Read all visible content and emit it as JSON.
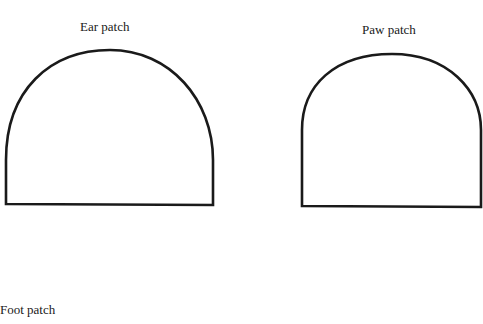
{
  "patches": [
    {
      "id": "ear",
      "label": "Ear patch"
    },
    {
      "id": "paw",
      "label": "Paw patch"
    },
    {
      "id": "foot",
      "label": "Foot patch"
    }
  ],
  "stroke_color": "#1a1a1a",
  "background": "#ffffff"
}
